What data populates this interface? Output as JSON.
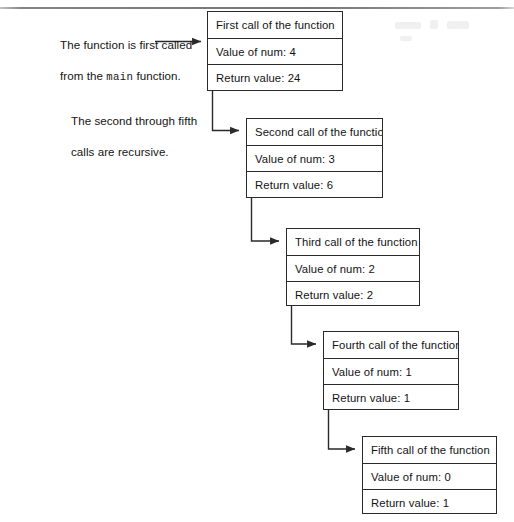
{
  "figure": {
    "background_color": "#ffffff",
    "line_color": "#2a2a2a",
    "text_color": "#131313"
  },
  "annotations": [
    {
      "id": "main-call-note",
      "line1": "The function is first called",
      "line2_prefix": "from the ",
      "line2_mono": "main",
      "line2_suffix": " function.",
      "has_arrow": true
    },
    {
      "id": "recursive-note",
      "line1": "The second through fifth",
      "line2": "calls are recursive.",
      "has_arrow": false
    }
  ],
  "call_frames": [
    {
      "id": "first-call",
      "title": "First call of the function",
      "value_label": "Value of num: 4",
      "return_label": "Return value: 24"
    },
    {
      "id": "second-call",
      "title": "Second call of the function",
      "value_label": "Value of num: 3",
      "return_label": "Return value: 6"
    },
    {
      "id": "third-call",
      "title": "Third call of the function",
      "value_label": "Value of num: 2",
      "return_label": "Return value: 2"
    },
    {
      "id": "fourth-call",
      "title": "Fourth call of the function",
      "value_label": "Value of num: 1",
      "return_label": "Return value: 1"
    },
    {
      "id": "fifth-call",
      "title": "Fifth call of the function",
      "value_label": "Value of num: 0",
      "return_label": "Return value: 1"
    }
  ]
}
